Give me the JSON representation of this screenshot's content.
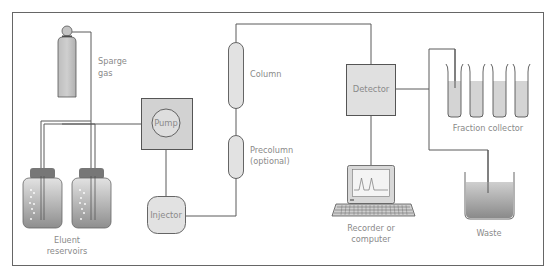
{
  "diagram": {
    "colors": {
      "frame": "#666666",
      "line": "#5a5a5a",
      "box_fill": "#d6d6d6",
      "light_fill": "#e4e4e4",
      "label": "#8a8a8a",
      "liquid_top": "#d8d8d8",
      "liquid_bottom": "#8c8c8c"
    },
    "components": {
      "sparge_gas": {
        "label_line1": "Sparge",
        "label_line2": "gas"
      },
      "eluent_reservoirs": {
        "label_line1": "Eluent",
        "label_line2": "reservoirs",
        "count": 2
      },
      "pump": {
        "label": "Pump"
      },
      "injector": {
        "label": "Injector"
      },
      "column": {
        "label": "Column"
      },
      "precolumn": {
        "label_line1": "Precolumn",
        "label_line2": "(optional)"
      },
      "detector": {
        "label": "Detector"
      },
      "recorder": {
        "label_line1": "Recorder or",
        "label_line2": "computer"
      },
      "fraction_collector": {
        "label": "Fraction collector",
        "tube_count": 4
      },
      "waste": {
        "label": "Waste"
      }
    }
  }
}
